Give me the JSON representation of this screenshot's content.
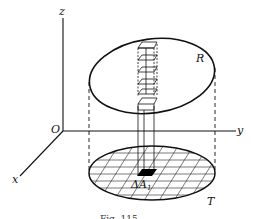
{
  "figure": {
    "caption": "Fig. 115",
    "axes": {
      "origin_label": "O",
      "x_label": "x",
      "y_label": "y",
      "z_label": "z"
    },
    "regions": {
      "surface_label": "R",
      "projection_label": "T",
      "element_label": "ΔA",
      "element_subscript": "1"
    },
    "colors": {
      "stroke": "#111111",
      "background": "#ffffff",
      "element_fill": "#000000"
    }
  }
}
